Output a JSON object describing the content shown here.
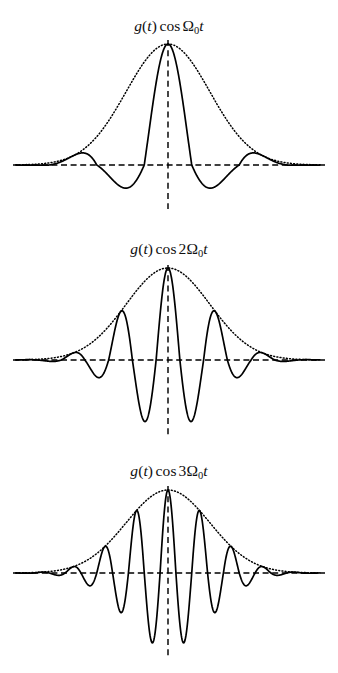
{
  "figure": {
    "name": "amplitude-modulation-panels",
    "background": "#ffffff",
    "ink": "#000000",
    "panel_count": 3
  },
  "panels": [
    {
      "id": "panel-1",
      "title_plain": "g(t) cos Ω₀t",
      "title_parts": {
        "fn": "g",
        "open": "(",
        "arg": "t",
        "close": ")",
        "op": "cos",
        "coefficient": "",
        "omega": "Ω",
        "subscript": "0",
        "time": "t"
      },
      "harmonic": 1,
      "axis_y": 165,
      "center_x": 168,
      "peak_y": 44,
      "min_y": 206
    },
    {
      "id": "panel-2",
      "title_plain": "g(t) cos 2Ω₀t",
      "title_parts": {
        "fn": "g",
        "open": "(",
        "arg": "t",
        "close": ")",
        "op": "cos",
        "coefficient": "2",
        "omega": "Ω",
        "subscript": "0",
        "time": "t"
      },
      "harmonic": 2,
      "axis_y": 360,
      "center_x": 168,
      "peak_y": 268,
      "min_y": 432
    },
    {
      "id": "panel-3",
      "title_plain": "g(t) cos 3Ω₀t",
      "title_parts": {
        "fn": "g",
        "open": "(",
        "arg": "t",
        "close": ")",
        "op": "cos",
        "coefficient": "3",
        "omega": "Ω",
        "subscript": "0",
        "time": "t"
      },
      "harmonic": 3,
      "axis_y": 573,
      "center_x": 168,
      "peak_y": 490,
      "min_y": 648
    }
  ],
  "chart_data": [
    {
      "type": "line",
      "title": "g(t) cos Ω₀t",
      "xlabel": "",
      "ylabel": "",
      "grid": false,
      "legend": "none",
      "xlim": [
        -3.2,
        3.2
      ],
      "ylim": [
        -1.05,
        1.05
      ],
      "x_axis_style": "dashed",
      "center_axis_style": "dashed",
      "envelope_style": "dotted",
      "signal_style": "solid",
      "envelope_formula": "g(t) = exp(-t^2 / 1.55)",
      "signal_formula": "g(t) * cos(1 * pi * t)",
      "series": [
        {
          "name": "envelope g(t)",
          "style": "dotted",
          "x": [
            -3.2,
            -3.0,
            -2.8,
            -2.6,
            -2.4,
            -2.2,
            -2.0,
            -1.8,
            -1.6,
            -1.4,
            -1.2,
            -1.0,
            -0.8,
            -0.6,
            -0.4,
            -0.2,
            0.0,
            0.2,
            0.4,
            0.6,
            0.8,
            1.0,
            1.2,
            1.4,
            1.6,
            1.8,
            2.0,
            2.2,
            2.4,
            2.6,
            2.8,
            3.0,
            3.2
          ],
          "values": [
            0.001,
            0.003,
            0.006,
            0.013,
            0.024,
            0.044,
            0.075,
            0.123,
            0.188,
            0.276,
            0.394,
            0.524,
            0.661,
            0.792,
            0.902,
            0.974,
            1.0,
            0.974,
            0.902,
            0.792,
            0.661,
            0.524,
            0.394,
            0.276,
            0.188,
            0.123,
            0.075,
            0.044,
            0.024,
            0.013,
            0.006,
            0.003,
            0.001
          ]
        },
        {
          "name": "g(t) cos Ω₀t",
          "style": "solid",
          "x": [
            -3.2,
            -3.0,
            -2.8,
            -2.6,
            -2.4,
            -2.2,
            -2.0,
            -1.8,
            -1.6,
            -1.4,
            -1.2,
            -1.0,
            -0.8,
            -0.6,
            -0.4,
            -0.2,
            0.0,
            0.2,
            0.4,
            0.6,
            0.8,
            1.0,
            1.2,
            1.4,
            1.6,
            1.8,
            2.0,
            2.2,
            2.4,
            2.6,
            2.8,
            3.0,
            3.2
          ],
          "values": [
            0.001,
            -0.003,
            0.005,
            -0.012,
            0.019,
            -0.036,
            0.075,
            -0.1,
            0.11,
            -0.224,
            0.244,
            -0.524,
            0.535,
            -0.641,
            0.729,
            -0.925,
            1.0,
            -0.925,
            0.729,
            -0.641,
            0.535,
            -0.524,
            0.244,
            -0.224,
            0.11,
            -0.1,
            0.075,
            -0.036,
            0.019,
            -0.012,
            0.005,
            -0.003,
            0.001
          ]
        }
      ]
    },
    {
      "type": "line",
      "title": "g(t) cos 2Ω₀t",
      "xlabel": "",
      "ylabel": "",
      "grid": false,
      "legend": "none",
      "xlim": [
        -3.2,
        3.2
      ],
      "ylim": [
        -1.05,
        1.05
      ],
      "x_axis_style": "dashed",
      "center_axis_style": "dashed",
      "envelope_style": "dotted",
      "signal_style": "solid",
      "envelope_formula": "g(t) = exp(-t^2 / 1.55)",
      "signal_formula": "g(t) * cos(2 * pi * t)",
      "series": [
        {
          "name": "envelope g(t)",
          "style": "dotted",
          "x": [
            -3.2,
            -2.8,
            -2.4,
            -2.0,
            -1.6,
            -1.2,
            -0.8,
            -0.4,
            0.0,
            0.4,
            0.8,
            1.2,
            1.6,
            2.0,
            2.4,
            2.8,
            3.2
          ],
          "values": [
            0.001,
            0.006,
            0.024,
            0.075,
            0.188,
            0.394,
            0.661,
            0.902,
            1.0,
            0.902,
            0.661,
            0.394,
            0.188,
            0.075,
            0.024,
            0.006,
            0.001
          ]
        },
        {
          "name": "g(t) cos 2Ω₀t",
          "style": "solid",
          "x": [
            -3.0,
            -2.75,
            -2.5,
            -2.25,
            -2.0,
            -1.75,
            -1.5,
            -1.25,
            -1.0,
            -0.75,
            -0.5,
            -0.25,
            0.0,
            0.25,
            0.5,
            0.75,
            1.0,
            1.25,
            1.5,
            1.75,
            2.0,
            2.25,
            2.5,
            2.75,
            3.0
          ],
          "values": [
            0.003,
            -0.007,
            0.017,
            -0.037,
            0.075,
            -0.14,
            0.237,
            -0.36,
            0.524,
            -0.702,
            0.0,
            0.0,
            1.0,
            0.0,
            0.0,
            -0.702,
            0.524,
            -0.36,
            0.237,
            -0.14,
            0.075,
            -0.037,
            0.017,
            -0.007,
            0.003
          ]
        }
      ]
    },
    {
      "type": "line",
      "title": "g(t) cos 3Ω₀t",
      "xlabel": "",
      "ylabel": "",
      "grid": false,
      "legend": "none",
      "xlim": [
        -3.2,
        3.2
      ],
      "ylim": [
        -1.05,
        1.05
      ],
      "x_axis_style": "dashed",
      "center_axis_style": "dashed",
      "envelope_style": "dotted",
      "signal_style": "solid",
      "envelope_formula": "g(t) = exp(-t^2 / 1.55)",
      "signal_formula": "g(t) * cos(3 * pi * t)",
      "series": [
        {
          "name": "envelope g(t)",
          "style": "dotted",
          "x": [
            -3.2,
            -2.8,
            -2.4,
            -2.0,
            -1.6,
            -1.2,
            -0.8,
            -0.4,
            0.0,
            0.4,
            0.8,
            1.2,
            1.6,
            2.0,
            2.4,
            2.8,
            3.2
          ],
          "values": [
            0.001,
            0.006,
            0.024,
            0.075,
            0.188,
            0.394,
            0.661,
            0.902,
            1.0,
            0.902,
            0.661,
            0.394,
            0.188,
            0.075,
            0.024,
            0.006,
            0.001
          ]
        },
        {
          "name": "g(t) cos 3Ω₀t",
          "style": "solid",
          "x": [
            -3.0,
            -2.666,
            -2.333,
            -2.0,
            -1.666,
            -1.333,
            -1.0,
            -0.666,
            -0.333,
            0.0,
            0.333,
            0.666,
            1.0,
            1.333,
            1.666,
            2.0,
            2.333,
            2.666,
            3.0
          ],
          "values": [
            -0.003,
            0.01,
            -0.03,
            0.075,
            -0.168,
            0.326,
            -0.524,
            0.752,
            -0.93,
            1.0,
            -0.93,
            0.752,
            -0.524,
            0.326,
            -0.168,
            0.075,
            -0.03,
            0.01,
            -0.003
          ]
        }
      ]
    }
  ],
  "geometry": {
    "axis_x_start": 13,
    "axis_x_end": 325,
    "center_x": 168,
    "signal_x_start": 18,
    "signal_x_end": 320
  }
}
